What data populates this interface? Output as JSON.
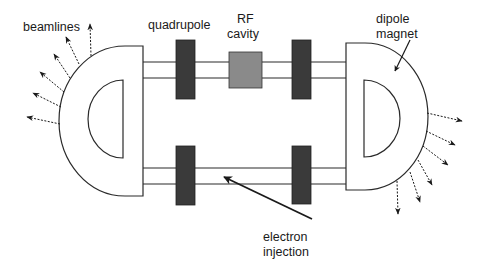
{
  "diagram": {
    "type": "storage-ring schematic",
    "labels": {
      "beamlines": "beamlines",
      "quadrupole": "quadrupole",
      "rf_line1": "RF",
      "rf_line2": "cavity",
      "dipole_line1": "dipole",
      "dipole_line2": "magnet",
      "injection_line1": "electron",
      "injection_line2": "injection"
    },
    "components": [
      {
        "id": "dipole-left",
        "kind": "dipole magnet"
      },
      {
        "id": "dipole-right",
        "kind": "dipole magnet"
      },
      {
        "id": "quad-top-left",
        "kind": "quadrupole"
      },
      {
        "id": "quad-top-right",
        "kind": "quadrupole"
      },
      {
        "id": "quad-bottom-left",
        "kind": "quadrupole"
      },
      {
        "id": "quad-bottom-right",
        "kind": "quadrupole"
      },
      {
        "id": "rf-cavity",
        "kind": "RF cavity"
      }
    ],
    "beamline_counts": {
      "left": 6,
      "right": 6
    },
    "colors": {
      "line": "#2a2a2a",
      "quadrupole": "#3a3a3a",
      "rf_cavity": "#8a8a8a",
      "background": "#ffffff"
    }
  }
}
